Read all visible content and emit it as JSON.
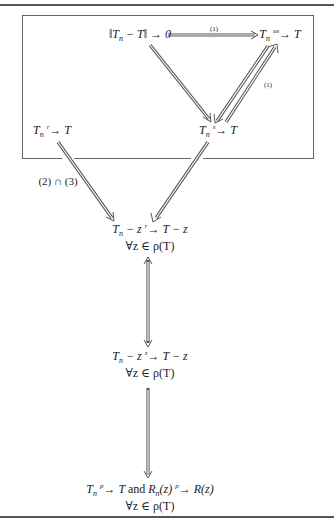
{
  "diagram": {
    "nodes": {
      "norm": {
        "lhs": "‖T",
        "sub": "n",
        "rest": " − T‖ → 0"
      },
      "us": {
        "T1": "T",
        "sub": "n",
        "arrow_label": "us",
        "arrow": "→",
        "T2": " T"
      },
      "s": {
        "T1": "T",
        "sub": "n",
        "arrow_label": "s",
        "arrow": "→",
        "T2": " T"
      },
      "r": {
        "T1": "T",
        "sub": "n",
        "arrow_label": "r",
        "arrow": "→",
        "T2": " T"
      },
      "shift_r": {
        "T1": "T",
        "sub": "n",
        "mid": " − z ",
        "arrow_label": "r",
        "arrow": "→",
        "T2": " T − z",
        "quant": "∀z ∈ ρ(T)"
      },
      "shift_s": {
        "T1": "T",
        "sub": "n",
        "mid": " − z ",
        "arrow_label": "s",
        "arrow": "→",
        "T2": " T − z",
        "quant": "∀z ∈ ρ(T)"
      },
      "resolvent": {
        "T1": "T",
        "sub": "n",
        "arrow_label": "p",
        "arrow": "→",
        "T2": " T ",
        "and": "and",
        "R1": " R",
        "Rsub": "n",
        "R1rest": "(z) ",
        "arrow_label2": "p",
        "arrow2": "→",
        "R2": " R(z)",
        "quant": "∀z ∈ ρ(T)"
      }
    },
    "edge_labels": {
      "norm_to_us": "(1)",
      "s_to_us": "(1)",
      "r_to_shift": "(2) ∩ (3)"
    },
    "colors": {
      "line": "#555555",
      "text": "#222222",
      "background": "#ffffff"
    }
  }
}
